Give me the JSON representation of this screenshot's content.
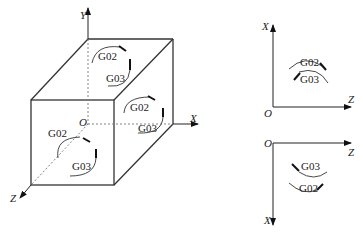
{
  "figure": {
    "cube": {
      "axes": {
        "y": "Y",
        "x": "X",
        "z": "Z",
        "origin": "O"
      },
      "top_face": {
        "cw": "G02",
        "ccw": "G03"
      },
      "right_face": {
        "cw": "G02",
        "ccw": "G03"
      },
      "front_face": {
        "cw": "G02",
        "ccw": "G03"
      }
    },
    "xz_plane_upper": {
      "vertical_axis": "X",
      "horizontal_axis": "Z",
      "origin": "O",
      "upper_arc": "G02",
      "lower_arc": "G03"
    },
    "xz_plane_lower": {
      "vertical_axis": "X",
      "horizontal_axis": "Z",
      "origin": "O",
      "upper_arc": "G03",
      "lower_arc": "G02"
    },
    "colors": {
      "line": "#333333",
      "dash": "#777777",
      "arrow": "#111111"
    }
  }
}
